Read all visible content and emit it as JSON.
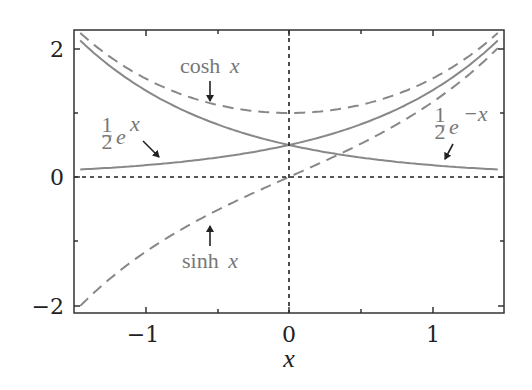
{
  "chart_data": {
    "type": "line",
    "title": "",
    "xlabel": "x",
    "ylabel": "",
    "xlim": [
      -1.5,
      1.5
    ],
    "ylim": [
      -2.1,
      2.3
    ],
    "xticks": [
      -1,
      0,
      1
    ],
    "xtick_labels": [
      "−1",
      "0",
      "1"
    ],
    "xminor_ticks": [
      -0.5,
      0.5
    ],
    "yticks": [
      -2,
      0,
      2
    ],
    "ytick_labels": [
      "−2",
      "0",
      "2"
    ],
    "yminor_ticks": [
      -1,
      1
    ],
    "grid": false,
    "reference_lines": [
      {
        "orientation": "horizontal",
        "value": 0,
        "style": "dotted"
      },
      {
        "orientation": "vertical",
        "value": 0,
        "style": "dotted"
      }
    ],
    "series": [
      {
        "name": "cosh x",
        "style": "dashed",
        "color": "#888888",
        "function": "cosh(x)",
        "x": [
          -1.5,
          -1,
          -0.5,
          0,
          0.5,
          1,
          1.5
        ],
        "values": [
          2.35,
          1.54,
          1.13,
          1.0,
          1.13,
          1.54,
          2.35
        ]
      },
      {
        "name": "sinh x",
        "style": "dashed",
        "color": "#888888",
        "function": "sinh(x)",
        "x": [
          -1.5,
          -1,
          -0.5,
          0,
          0.5,
          1,
          1.5
        ],
        "values": [
          -2.13,
          -1.18,
          -0.52,
          0.0,
          0.52,
          1.18,
          2.13
        ]
      },
      {
        "name": "1/2 e^x",
        "style": "solid",
        "color": "#888888",
        "function": "0.5*exp(x)",
        "x": [
          -1.5,
          -1,
          -0.5,
          0,
          0.5,
          1,
          1.5
        ],
        "values": [
          0.11,
          0.18,
          0.3,
          0.5,
          0.82,
          1.36,
          2.24
        ]
      },
      {
        "name": "1/2 e^-x",
        "style": "solid",
        "color": "#888888",
        "function": "0.5*exp(-x)",
        "x": [
          -1.5,
          -1,
          -0.5,
          0,
          0.5,
          1,
          1.5
        ],
        "values": [
          2.24,
          1.36,
          0.82,
          0.5,
          0.3,
          0.18,
          0.11
        ]
      }
    ],
    "annotations": [
      {
        "text": "cosh x",
        "arrow_to": [
          -0.55,
          1.15
        ]
      },
      {
        "text": "½ e^x",
        "arrow_to": [
          -0.9,
          0.2
        ]
      },
      {
        "text": "½ e^−x",
        "arrow_to": [
          1.08,
          0.17
        ]
      },
      {
        "text": "sinh x",
        "arrow_to": [
          -0.55,
          -0.75
        ]
      }
    ]
  },
  "labels": {
    "cosh": "cosh",
    "sinh": "sinh",
    "x": "x",
    "half_num": "1",
    "half_den": "2",
    "e": "e",
    "exp_pos": "x",
    "exp_neg": "−x",
    "xtick_m1": "−1",
    "xtick_0": "0",
    "xtick_1": "1",
    "ytick_2": "2",
    "ytick_0": "0",
    "ytick_m2": "−2",
    "xlabel": "x"
  },
  "colors": {
    "curve": "#888888",
    "axis": "#333333",
    "text": "#222222",
    "label": "#777777"
  }
}
